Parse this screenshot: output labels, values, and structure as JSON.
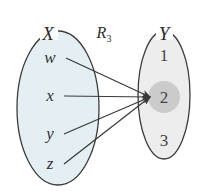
{
  "diagram": {
    "relation": {
      "base": "R",
      "subscript": "3",
      "full_label": "R_3",
      "x": 104,
      "y": 38
    },
    "domain_set": {
      "name": "X",
      "label_x": 48,
      "label_y": 40,
      "ellipse": {
        "cx": 58,
        "cy": 108,
        "rx": 41,
        "ry": 77
      },
      "fill": "#e3eff2",
      "stroke": "#3c3c3c",
      "elements": [
        {
          "label": "w",
          "x": 50,
          "y": 63,
          "anchor_x": 66,
          "anchor_y": 58
        },
        {
          "label": "x",
          "x": 50,
          "y": 101,
          "anchor_x": 64,
          "anchor_y": 96
        },
        {
          "label": "y",
          "x": 50,
          "y": 139,
          "anchor_x": 64,
          "anchor_y": 134
        },
        {
          "label": "z",
          "x": 50,
          "y": 169,
          "anchor_x": 64,
          "anchor_y": 164
        }
      ]
    },
    "codomain_set": {
      "name": "Y",
      "label_x": 164,
      "label_y": 40,
      "ellipse": {
        "cx": 164,
        "cy": 95,
        "rx": 26,
        "ry": 64
      },
      "fill": "#ededed",
      "stroke": "#3c3c3c",
      "elements": [
        {
          "label": "1",
          "x": 164,
          "y": 61,
          "highlighted": false
        },
        {
          "label": "2",
          "x": 164,
          "y": 103,
          "highlighted": true
        },
        {
          "label": "3",
          "x": 164,
          "y": 146,
          "highlighted": false
        }
      ],
      "highlight": {
        "cx": 164,
        "cy": 97,
        "r": 16,
        "fill": "#c9c9c9"
      }
    },
    "target_point": {
      "x": 150,
      "y": 97
    },
    "arrows": [
      {
        "from": "w",
        "to": "2",
        "x1": 66,
        "y1": 58,
        "x2": 150,
        "y2": 97
      },
      {
        "from": "x",
        "to": "2",
        "x1": 64,
        "y1": 96,
        "x2": 150,
        "y2": 97
      },
      {
        "from": "y",
        "to": "2",
        "x1": 64,
        "y1": 134,
        "x2": 150,
        "y2": 97
      },
      {
        "from": "z",
        "to": "2",
        "x1": 64,
        "y1": 164,
        "x2": 150,
        "y2": 97
      }
    ],
    "arrow_stroke": "#3a3a3a"
  }
}
